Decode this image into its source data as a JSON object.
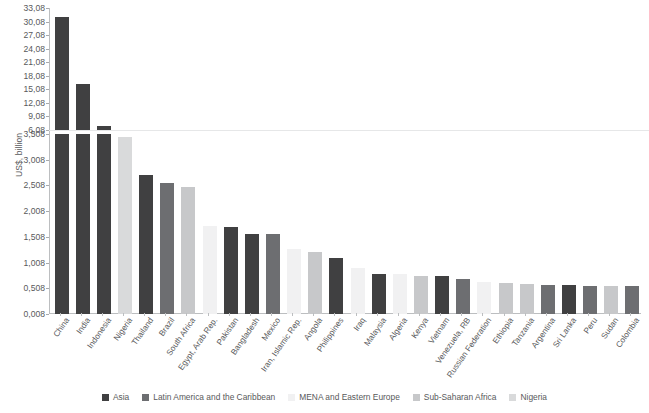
{
  "chart_data": {
    "type": "bar",
    "title": "",
    "xlabel": "",
    "ylabel": "US$, billion",
    "grid": false,
    "legend_position": "bottom",
    "broken_axis": true,
    "axis_note": "Y axis is broken: lower panel 0,008-3,508 ; upper panel 6,08-33,08",
    "yticks_bottom": [
      "0,008",
      "0,508",
      "1,008",
      "1,508",
      "2,008",
      "2,508",
      "3,008",
      "3,508"
    ],
    "yticks_top": [
      "6,08",
      "9,08",
      "12,08",
      "15,08",
      "18,08",
      "21,08",
      "24,08",
      "27,08",
      "30,08",
      "33,08"
    ],
    "ylim_bottom": [
      0.008,
      3.508
    ],
    "ylim_top": [
      6.08,
      33.08
    ],
    "categories": [
      "China",
      "India",
      "Indonesia",
      "Nigeria",
      "Thailand",
      "Brazil",
      "South Africa",
      "Egypt, Arab Rep.",
      "Pakistan",
      "Bangladesh",
      "Mexico",
      "Iran, Islamic Rep.",
      "Angola",
      "Philippines",
      "Iraq",
      "Malaysia",
      "Algeria",
      "Kenya",
      "Vietnam",
      "Venezuela, RB",
      "Russian Federation",
      "Ethiopia",
      "Tanzania",
      "Argentina",
      "Sri Lanka",
      "Peru",
      "Sudan",
      "Colombia"
    ],
    "values": [
      31.0,
      16.2,
      6.9,
      3.45,
      2.72,
      2.56,
      2.48,
      1.72,
      1.7,
      1.57,
      1.56,
      1.28,
      1.22,
      1.1,
      0.9,
      0.79,
      0.78,
      0.75,
      0.74,
      0.68,
      0.63,
      0.62,
      0.6,
      0.58,
      0.57,
      0.56,
      0.56,
      0.56
    ],
    "groups": [
      "Asia",
      "Asia",
      "Asia",
      "Nigeria",
      "Asia",
      "Latin America and the Caribbean",
      "Sub-Saharan Africa",
      "MENA and Eastern Europe",
      "Asia",
      "Asia",
      "Latin America and the Caribbean",
      "MENA and Eastern Europe",
      "Sub-Saharan Africa",
      "Asia",
      "MENA and Eastern Europe",
      "Asia",
      "MENA and Eastern Europe",
      "Sub-Saharan Africa",
      "Asia",
      "Latin America and the Caribbean",
      "MENA and Eastern Europe",
      "Sub-Saharan Africa",
      "Sub-Saharan Africa",
      "Latin America and the Caribbean",
      "Asia",
      "Latin America and the Caribbean",
      "Sub-Saharan Africa",
      "Latin America and the Caribbean"
    ],
    "legend": [
      {
        "label": "Asia",
        "color": "#404041"
      },
      {
        "label": "Latin America and the Caribbean",
        "color": "#6d6e71"
      },
      {
        "label": "MENA and Eastern Europe",
        "color": "#f1f1f2"
      },
      {
        "label": "Sub-Saharan Africa",
        "color": "#c7c8ca"
      },
      {
        "label": "Nigeria",
        "color": "#d9dadb"
      }
    ]
  }
}
